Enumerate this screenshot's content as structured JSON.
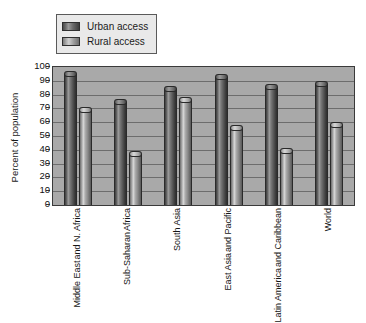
{
  "chart_data": {
    "type": "bar",
    "title": "",
    "xlabel": "",
    "ylabel": "Percent of population",
    "ylim": [
      0,
      100
    ],
    "ytick_step": 10,
    "grid": true,
    "legend_position": "top-left",
    "categories": [
      "Middle East and N. Africa",
      "Sub-Saharan Africa",
      "South Asia",
      "East Asia and Pacific",
      "Latin America and Caribbean",
      "World"
    ],
    "category_lines": [
      [
        "Middle East",
        "and N. Africa"
      ],
      [
        "Sub-Saharan",
        "Africa"
      ],
      [
        "South Asia"
      ],
      [
        "East Asia",
        "and Pacific"
      ],
      [
        "Latin America",
        "and Caribbean"
      ],
      [
        "World"
      ]
    ],
    "yticks": [
      0,
      10,
      20,
      30,
      40,
      50,
      60,
      70,
      80,
      90,
      100
    ],
    "series": [
      {
        "name": "Urban access",
        "color": "#555555",
        "values": [
          97,
          77,
          86,
          95,
          88,
          90
        ]
      },
      {
        "name": "Rural access",
        "color": "#b0b0b0",
        "values": [
          71,
          39,
          78,
          58,
          41,
          60
        ]
      }
    ]
  },
  "legend": {
    "items": [
      {
        "label": "Urban access",
        "swatch": "urban"
      },
      {
        "label": "Rural access",
        "swatch": "rural"
      }
    ]
  },
  "colors": {
    "plot_background": "#a9a9a9",
    "gridline": "#6d6d6d",
    "axis": "#3a3a3a",
    "page_background": "#ffffff"
  }
}
